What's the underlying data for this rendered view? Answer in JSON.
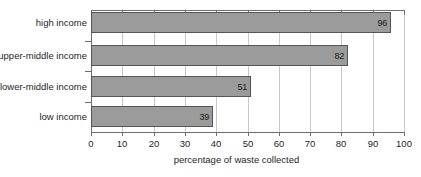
{
  "chart_data": {
    "type": "bar",
    "orientation": "horizontal",
    "title": "",
    "xlabel": "percentage of waste collected",
    "ylabel": "",
    "categories": [
      "high income",
      "upper-middle income",
      "lower-middle income",
      "low income"
    ],
    "values": [
      96,
      82,
      51,
      39
    ],
    "value_labels": [
      "96",
      "82",
      "51",
      "39"
    ],
    "xlim": [
      0,
      100
    ],
    "xticks": [
      0,
      10,
      20,
      30,
      40,
      50,
      60,
      70,
      80,
      90,
      100
    ],
    "xtick_labels": [
      "0",
      "10",
      "20",
      "30",
      "40",
      "50",
      "60",
      "70",
      "80",
      "90",
      "100"
    ],
    "grid": "vertical",
    "legend": "none",
    "colors": {
      "bar_fill": "#9b9b9b",
      "bar_stroke": "#555555",
      "axis": "#6e6e6e",
      "gridline": "#c9c9c9",
      "text": "#1f1f1f",
      "background": "#ffffff"
    }
  }
}
